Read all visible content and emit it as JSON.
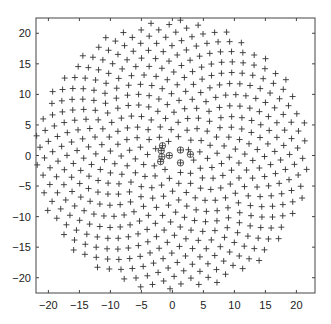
{
  "chart_data": {
    "type": "scatter",
    "title": "",
    "xlabel": "",
    "ylabel": "",
    "xlim": [
      -22,
      23
    ],
    "ylim": [
      -22.5,
      22.5
    ],
    "grid": false,
    "legend": null,
    "x_ticks": [
      -20,
      -15,
      -10,
      -5,
      0,
      5,
      10,
      15,
      20
    ],
    "y_ticks": [
      -20,
      -15,
      -10,
      -5,
      0,
      5,
      10,
      15,
      20
    ],
    "marker": "+",
    "marker_color": "#333333",
    "series": [
      {
        "name": "points",
        "generator": {
          "kind": "vogel_spiral",
          "count": 520,
          "radius": 22.2,
          "golden_angle_deg": 137.508
        }
      },
      {
        "name": "circled-center-points",
        "marker": "circle-plus",
        "x": [
          -1.8,
          -1.7,
          -1.9,
          -1.6,
          -0.5,
          1.3,
          2.9,
          1.3
        ],
        "y": [
          0.8,
          -0.2,
          -1.0,
          1.6,
          0.0,
          0.9,
          0.2,
          -1.2
        ]
      }
    ]
  }
}
